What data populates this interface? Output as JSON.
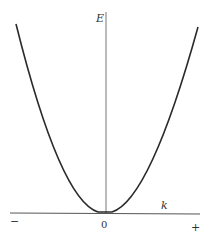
{
  "diagram": {
    "type": "energy-dispersion-parabola",
    "axes": {
      "vertical_label": "E",
      "horizontal_label": "k",
      "origin_label": "0",
      "negative_label": "−",
      "positive_label": "+"
    },
    "curve": {
      "description": "Parabola E ∝ k² with vertex at origin",
      "color": "#2a2a2a"
    },
    "colors": {
      "axis": "#555555",
      "text": "#333333",
      "background": "#ffffff"
    }
  }
}
